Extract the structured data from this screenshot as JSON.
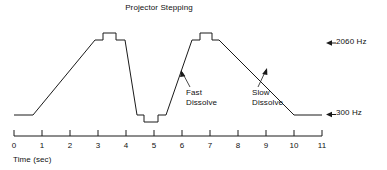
{
  "figure": {
    "title": "Projector Stepping",
    "axis_title": "Time (sec)",
    "annotations": {
      "fast": "Fast\nDissolve",
      "slow": "Slow\nDissolve"
    },
    "levels": {
      "high": "2060 Hz",
      "low": "300 Hz"
    },
    "arrow_glyph": "←",
    "line_color": "#1a1a1a",
    "background_color": "#ffffff"
  },
  "chart_data": {
    "type": "line",
    "title": "Projector Stepping",
    "xlabel": "Time (sec)",
    "ylabel": "",
    "xlim": [
      0,
      11
    ],
    "ylim": [
      300,
      2060
    ],
    "grid": false,
    "legend": null,
    "xticks": [
      0,
      1,
      2,
      3,
      4,
      5,
      6,
      7,
      8,
      9,
      10,
      11
    ],
    "xticklabels": [
      "0",
      "1",
      "2",
      "3",
      "4",
      "5",
      "6",
      "7",
      "8",
      "9",
      "10",
      "11"
    ],
    "y_reference_levels": [
      {
        "value": 2060,
        "label": "2060 Hz"
      },
      {
        "value": 300,
        "label": "300 Hz"
      }
    ],
    "series": [
      {
        "name": "Projector drive frequency",
        "x": [
          0.0,
          0.75,
          2.85,
          3.15,
          3.15,
          3.65,
          3.65,
          4.0,
          4.45,
          4.7,
          4.7,
          5.25,
          5.25,
          5.75,
          5.75,
          6.0,
          6.75,
          6.95,
          6.95,
          7.35,
          7.35,
          7.6,
          10.45,
          11.0
        ],
        "values": [
          300,
          300,
          2060,
          2060,
          2250,
          2250,
          2060,
          2060,
          300,
          300,
          130,
          130,
          300,
          300,
          300,
          2060,
          2060,
          2060,
          2250,
          2250,
          2060,
          2060,
          300,
          300
        ]
      }
    ],
    "annotations": [
      {
        "text": "Projector Stepping",
        "target_x": 3.4,
        "target_y": 2250,
        "role": "peak-step-callout"
      },
      {
        "text": "Fast Dissolve",
        "target_x": 6.15,
        "target_y": 900,
        "role": "rise-slope-callout"
      },
      {
        "text": "Slow Dissolve",
        "target_x": 8.85,
        "target_y": 1150,
        "role": "fall-slope-callout"
      }
    ]
  },
  "ticks": [
    {
      "label": "0",
      "x": 14
    },
    {
      "label": "1",
      "x": 42
    },
    {
      "label": "2",
      "x": 70
    },
    {
      "label": "3",
      "x": 98
    },
    {
      "label": "4",
      "x": 126
    },
    {
      "label": "5",
      "x": 154
    },
    {
      "label": "6",
      "x": 182
    },
    {
      "label": "7",
      "x": 210
    },
    {
      "label": "8",
      "x": 238
    },
    {
      "label": "9",
      "x": 266
    },
    {
      "label": "10",
      "x": 294
    },
    {
      "label": "11",
      "x": 322
    }
  ]
}
